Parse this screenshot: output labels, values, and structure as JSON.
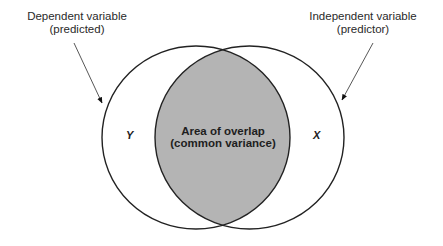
{
  "diagram": {
    "type": "venn",
    "left_label": {
      "line1": "Dependent variable",
      "line2": "(predicted)"
    },
    "right_label": {
      "line1": "Independent variable",
      "line2": "(predictor)"
    },
    "left_set": "Y",
    "right_set": "X",
    "overlap_label": {
      "line1": "Area of overlap",
      "line2": "(common variance)"
    },
    "colors": {
      "overlap_fill": "#b4b4b4",
      "stroke": "#222222",
      "background": "#ffffff"
    }
  }
}
